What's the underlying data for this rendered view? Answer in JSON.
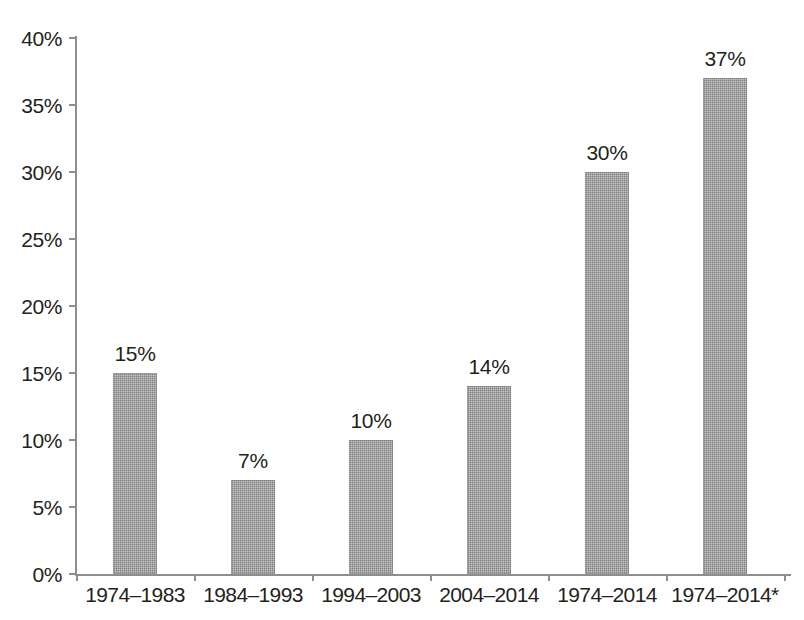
{
  "chart_data": {
    "type": "bar",
    "title": "",
    "subtitle": "",
    "xlabel": "",
    "ylabel": "",
    "categories": [
      "1974–1983",
      "1984–1993",
      "1994–2003",
      "2004–2014",
      "1974–2014",
      "1974–2014*"
    ],
    "values": [
      15,
      7,
      10,
      14,
      30,
      37
    ],
    "data_labels": [
      "15%",
      "7%",
      "10%",
      "14%",
      "30%",
      "37%"
    ],
    "ylim": [
      0,
      40
    ],
    "ytick_values": [
      0,
      5,
      10,
      15,
      20,
      25,
      30,
      35,
      40
    ],
    "ytick_labels": [
      "0%",
      "5%",
      "10%",
      "15%",
      "20%",
      "25%",
      "30%",
      "35%",
      "40%"
    ],
    "grid": false,
    "legend": "none",
    "bar_color": "#808080",
    "axis_color": "#8e8e8e",
    "text_color": "#231f20",
    "background": "#ffffff",
    "annotations": []
  }
}
